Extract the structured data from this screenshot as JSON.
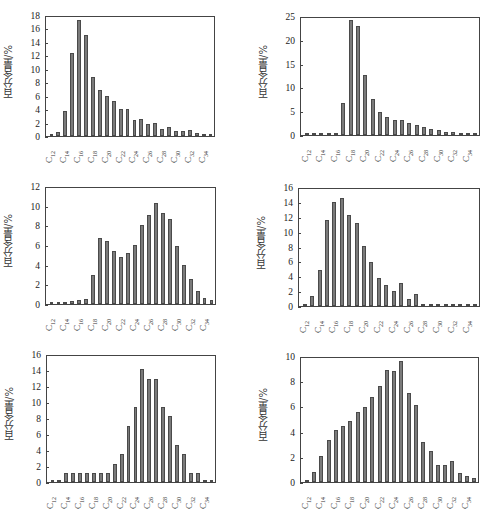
{
  "figure": {
    "ylabel": "百分含量/%"
  },
  "chart_data": [
    {
      "type": "bar",
      "title": "C2井，C1d",
      "title_main": "C2井，C",
      "title_sub": "1",
      "title_tail": "d",
      "xlabel": "",
      "ylabel": "百分含量/%",
      "ylim": [
        0,
        18
      ],
      "yticks": [
        0,
        2,
        4,
        6,
        8,
        10,
        12,
        14,
        16,
        18
      ],
      "categories": [
        "C12",
        "C13",
        "C14",
        "C15",
        "C16",
        "C17",
        "C18",
        "C19",
        "C20",
        "C21",
        "C22",
        "C23",
        "C24",
        "C25",
        "C26",
        "C27",
        "C28",
        "C29",
        "C30",
        "C31",
        "C32",
        "C33",
        "C34",
        "C35"
      ],
      "tick_labels": [
        "C12",
        "C14",
        "C16",
        "C18",
        "C20",
        "C22",
        "C24",
        "C26",
        "C28",
        "C30",
        "C32",
        "C34"
      ],
      "values": [
        0.1,
        0.6,
        3.8,
        12.5,
        17.4,
        15.2,
        8.8,
        6.9,
        6.0,
        5.3,
        4.0,
        4.0,
        2.4,
        2.6,
        1.8,
        1.9,
        1.1,
        1.3,
        0.8,
        0.8,
        0.9,
        0.4,
        0.1,
        0.1
      ],
      "grid": false,
      "legend": "none",
      "box": {
        "left": 45,
        "top": 16,
        "right": 215,
        "bottom": 137
      }
    },
    {
      "type": "bar",
      "title": "C32井，C2b",
      "title_main": "C32井，C",
      "title_sub": "2",
      "title_tail": "b",
      "xlabel": "",
      "ylabel": "百分含量/%",
      "ylim": [
        0,
        25
      ],
      "yticks": [
        0,
        5,
        10,
        15,
        20,
        25
      ],
      "categories": [
        "C12",
        "C13",
        "C14",
        "C15",
        "C16",
        "C17",
        "C18",
        "C19",
        "C20",
        "C21",
        "C22",
        "C23",
        "C24",
        "C25",
        "C26",
        "C27",
        "C28",
        "C29",
        "C30",
        "C31",
        "C32",
        "C33",
        "C34",
        "C35"
      ],
      "tick_labels": [
        "C12",
        "C14",
        "C16",
        "C18",
        "C20",
        "C22",
        "C24",
        "C26",
        "C28",
        "C30",
        "C32",
        "C34"
      ],
      "values": [
        0.1,
        0.1,
        0.1,
        0.1,
        0.5,
        6.7,
        24.3,
        23.2,
        12.7,
        7.6,
        4.9,
        3.9,
        3.1,
        3.1,
        2.5,
        2.2,
        1.7,
        1.3,
        1.0,
        0.7,
        0.7,
        0.4,
        0.1,
        0.1
      ],
      "grid": false,
      "legend": "none",
      "box": {
        "left": 300,
        "top": 17,
        "right": 480,
        "bottom": 136
      }
    },
    {
      "type": "bar",
      "title": "C36井，C2b",
      "title_main": "C36井，C",
      "title_sub": "2",
      "title_tail": "b",
      "xlabel": "",
      "ylabel": "百分含量/%",
      "ylim": [
        0,
        12
      ],
      "yticks": [
        0,
        2,
        4,
        6,
        8,
        10,
        12
      ],
      "categories": [
        "C12",
        "C13",
        "C14",
        "C15",
        "C16",
        "C17",
        "C18",
        "C19",
        "C20",
        "C21",
        "C22",
        "C23",
        "C24",
        "C25",
        "C26",
        "C27",
        "C28",
        "C29",
        "C30",
        "C31",
        "C32",
        "C33",
        "C34",
        "C35"
      ],
      "tick_labels": [
        "C12",
        "C14",
        "C16",
        "C18",
        "C20",
        "C22",
        "C24",
        "C26",
        "C28",
        "C30",
        "C32",
        "C34"
      ],
      "values": [
        0.05,
        0.05,
        0.15,
        0.3,
        0.4,
        0.5,
        3.0,
        6.8,
        6.5,
        5.4,
        4.8,
        5.2,
        6.1,
        8.1,
        9.1,
        10.4,
        9.3,
        8.7,
        6.0,
        4.0,
        2.6,
        1.3,
        0.6,
        0.4
      ],
      "grid": false,
      "legend": "none",
      "box": {
        "left": 45,
        "top": 187,
        "right": 216,
        "bottom": 305
      }
    },
    {
      "type": "bar",
      "title": "CC2井，C1d",
      "title_main": "CC2井，C",
      "title_sub": "1",
      "title_tail": "d",
      "xlabel": "",
      "ylabel": "百分含量/%",
      "ylim": [
        0,
        16
      ],
      "yticks": [
        0,
        2,
        4,
        6,
        8,
        10,
        12,
        14,
        16
      ],
      "categories": [
        "C12",
        "C13",
        "C14",
        "C15",
        "C16",
        "C17",
        "C18",
        "C19",
        "C20",
        "C21",
        "C22",
        "C23",
        "C24",
        "C25",
        "C26",
        "C27",
        "C28",
        "C29",
        "C30",
        "C31",
        "C32",
        "C33",
        "C34",
        "C35"
      ],
      "tick_labels": [
        "C12",
        "C14",
        "C16",
        "C18",
        "C20",
        "C22",
        "C24",
        "C26",
        "C28",
        "C30",
        "C32",
        "C34"
      ],
      "values": [
        0.2,
        1.3,
        4.9,
        11.7,
        14.1,
        14.6,
        12.4,
        11.2,
        8.2,
        6.0,
        3.8,
        2.8,
        2.0,
        3.1,
        1.0,
        1.6,
        0.05,
        0.05,
        0.05,
        0.05,
        0.05,
        0.05,
        0.05,
        0.05
      ],
      "grid": false,
      "legend": "none",
      "box": {
        "left": 298,
        "top": 188,
        "right": 480,
        "bottom": 307
      }
    },
    {
      "type": "bar",
      "title": "CS1井，C2b",
      "title_main": "CS1井，C",
      "title_sub": "2",
      "title_tail": "b",
      "xlabel": "",
      "ylabel": "百分含量/%",
      "ylim": [
        0,
        16
      ],
      "yticks": [
        0,
        2,
        4,
        6,
        8,
        10,
        12,
        14,
        16
      ],
      "categories": [
        "C12",
        "C13",
        "C14",
        "C15",
        "C16",
        "C17",
        "C18",
        "C19",
        "C20",
        "C21",
        "C22",
        "C23",
        "C24",
        "C25",
        "C26",
        "C27",
        "C28",
        "C29",
        "C30",
        "C31",
        "C32",
        "C33",
        "C34",
        "C35"
      ],
      "tick_labels": [
        "C12",
        "C14",
        "C16",
        "C18",
        "C20",
        "C22",
        "C24",
        "C26",
        "C28",
        "C30",
        "C32",
        "C34"
      ],
      "values": [
        0.05,
        0.05,
        1.1,
        1.1,
        1.1,
        1.1,
        1.1,
        1.1,
        1.1,
        2.3,
        3.5,
        7.1,
        9.5,
        14.2,
        13.0,
        13.0,
        9.5,
        8.3,
        4.7,
        3.5,
        1.1,
        1.1,
        0.05,
        0.05
      ],
      "grid": false,
      "legend": "none",
      "box": {
        "left": 46,
        "top": 355,
        "right": 216,
        "bottom": 483
      }
    },
    {
      "type": "bar",
      "title": "DZ1井，C2b",
      "title_main": "DZ1井，C",
      "title_sub": "2",
      "title_tail": "b",
      "xlabel": "",
      "ylabel": "百分含量/%",
      "ylim": [
        0,
        10
      ],
      "yticks": [
        0,
        2,
        4,
        6,
        8,
        10
      ],
      "categories": [
        "C12",
        "C13",
        "C14",
        "C15",
        "C16",
        "C17",
        "C18",
        "C19",
        "C20",
        "C21",
        "C22",
        "C23",
        "C24",
        "C25",
        "C26",
        "C27",
        "C28",
        "C29",
        "C30",
        "C31",
        "C32",
        "C33",
        "C34",
        "C35"
      ],
      "tick_labels": [
        "C12",
        "C14",
        "C16",
        "C18",
        "C20",
        "C22",
        "C24",
        "C26",
        "C28",
        "C30",
        "C32",
        "C34"
      ],
      "values": [
        0.2,
        0.8,
        2.1,
        3.4,
        4.2,
        4.5,
        4.9,
        5.6,
        6.0,
        6.8,
        7.7,
        9.0,
        8.9,
        9.7,
        7.1,
        6.2,
        3.2,
        2.5,
        1.4,
        1.4,
        1.7,
        0.7,
        0.5,
        0.35
      ],
      "grid": false,
      "legend": "none",
      "box": {
        "left": 300,
        "top": 357,
        "right": 479,
        "bottom": 483
      }
    }
  ]
}
